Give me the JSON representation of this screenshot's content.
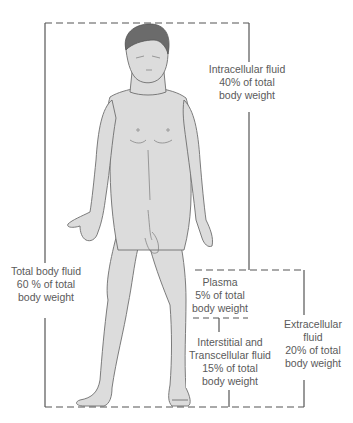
{
  "diagram": {
    "colors": {
      "line": "#555555",
      "skin_fill": "#d9d9d9",
      "skin_outline": "#6e6e6e",
      "hair": "#6b6b6b",
      "text": "#5a5a5a"
    },
    "labels": {
      "intracellular": {
        "line1": "Intracellular fluid",
        "line2": "40% of total",
        "line3": "body weight"
      },
      "total": {
        "line1": "Total body fluid",
        "line2": "60 % of total",
        "line3": "body weight"
      },
      "plasma": {
        "line1": "Plasma",
        "line2": "5% of total",
        "line3": "body weight"
      },
      "interstitial": {
        "line1": "Interstitial and",
        "line2": "Transcellular fluid",
        "line3": "15% of total",
        "line4": "body weight"
      },
      "extracellular": {
        "line1": "Extracellular",
        "line2": "fluid",
        "line3": "20% of total",
        "line4": "body weight"
      }
    }
  }
}
